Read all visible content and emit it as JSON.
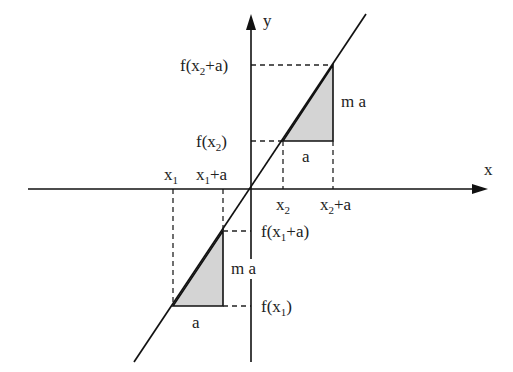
{
  "diagram": {
    "type": "linear-function-slope-illustration",
    "axes": {
      "x_label": "x",
      "y_label": "y"
    },
    "colors": {
      "line": "#111111",
      "fill": "#d4d4d4",
      "dash": "#222222"
    },
    "x_labels": {
      "x1": {
        "base": "x",
        "sub": "1",
        "rest": ""
      },
      "x1a": {
        "base": "x",
        "sub": "1",
        "rest": "+a"
      },
      "x2": {
        "base": "x",
        "sub": "2",
        "rest": ""
      },
      "x2a": {
        "base": "x",
        "sub": "2",
        "rest": "+a"
      }
    },
    "y_labels": {
      "fx2a": {
        "pre": "f(x",
        "sub": "2",
        "rest": "+a)"
      },
      "fx2": {
        "pre": "f(x",
        "sub": "2",
        "rest": ")"
      },
      "fx1a": {
        "pre": "f(x",
        "sub": "1",
        "rest": "+a)"
      },
      "fx1": {
        "pre": "f(x",
        "sub": "1",
        "rest": ")"
      }
    },
    "triangle_labels": {
      "run_upper": "a",
      "rise_upper": "m a",
      "run_lower": "a",
      "rise_lower": "m a"
    }
  }
}
